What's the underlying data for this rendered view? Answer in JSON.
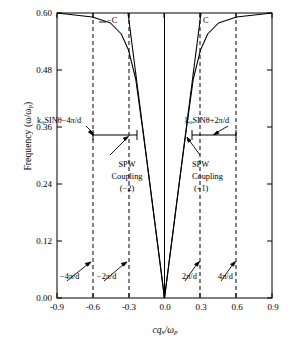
{
  "chart_data": {
    "type": "line",
    "title": "",
    "xlabel": "cq_x/ω_p",
    "ylabel": "Frequency (ω/ω_p)",
    "xlim": [
      -0.9,
      0.9
    ],
    "ylim": [
      0.0,
      0.6
    ],
    "xticks": [
      -0.9,
      -0.6,
      -0.3,
      0.0,
      0.3,
      0.6,
      0.9
    ],
    "xtick_labels": [
      "-0.9",
      "-0.6",
      "-0.3",
      "0.0",
      "0.3",
      "0.6",
      "0.9"
    ],
    "yticks": [
      0.0,
      0.12,
      0.24,
      0.36,
      0.48,
      0.6
    ],
    "ytick_labels": [
      "0.00",
      "0.12",
      "0.24",
      "0.36",
      "0.48",
      "0.60"
    ],
    "grid": false,
    "legend": "none",
    "series": [
      {
        "name": "light line +C",
        "style": "solid",
        "points": [
          [
            0.0,
            0.0
          ],
          [
            0.305,
            0.6
          ]
        ]
      },
      {
        "name": "light line -C",
        "style": "solid",
        "points": [
          [
            0.0,
            0.0
          ],
          [
            -0.305,
            0.6
          ]
        ]
      },
      {
        "name": "SPW dispersion right branch",
        "style": "solid",
        "points": [
          [
            0.0,
            0.0
          ],
          [
            0.06,
            0.118
          ],
          [
            0.12,
            0.236
          ],
          [
            0.18,
            0.352
          ],
          [
            0.24,
            0.462
          ],
          [
            0.3,
            0.522
          ],
          [
            0.36,
            0.556
          ],
          [
            0.45,
            0.578
          ],
          [
            0.6,
            0.591
          ],
          [
            0.75,
            0.597
          ],
          [
            0.9,
            0.6
          ]
        ]
      },
      {
        "name": "SPW dispersion left branch",
        "style": "solid",
        "points": [
          [
            0.0,
            0.0
          ],
          [
            -0.06,
            0.118
          ],
          [
            -0.12,
            0.236
          ],
          [
            -0.18,
            0.352
          ],
          [
            -0.24,
            0.462
          ],
          [
            -0.3,
            0.522
          ],
          [
            -0.36,
            0.556
          ],
          [
            -0.45,
            0.578
          ],
          [
            -0.6,
            0.591
          ],
          [
            -0.75,
            0.597
          ],
          [
            -0.9,
            0.6
          ]
        ]
      },
      {
        "name": "vertical axis line at zero",
        "style": "solid",
        "points": [
          [
            0.0,
            0.0
          ],
          [
            0.0,
            0.6
          ]
        ]
      }
    ],
    "vertical_dashed_lines": [
      {
        "x": -0.6,
        "label": "-4π/d"
      },
      {
        "x": -0.3,
        "label": "-2π/d"
      },
      {
        "x": 0.3,
        "label": "2π/d"
      },
      {
        "x": 0.6,
        "label": "4π/d"
      }
    ],
    "measurement_bars": [
      {
        "name": "left",
        "y": 0.355,
        "x_start": -0.47,
        "x_end": -0.095
      },
      {
        "name": "right",
        "y": 0.355,
        "x_start": 0.34,
        "x_end": 0.685
      }
    ]
  },
  "annotations": {
    "light_line_left": "−C",
    "light_line_right": "C",
    "k_left_html": "k<sub>o</sub>SINθ−4π/d",
    "k_right_html": "k<sub>o</sub>SINθ+2π/d",
    "spw_left_line1": "SPW",
    "spw_left_line2": "Coupling",
    "spw_left_line3": "(−2)",
    "spw_right_line1": "SPW",
    "spw_right_line2": "Coupling",
    "spw_right_line3": "(+1)",
    "bragg_neg4": "−4π/d",
    "bragg_neg2": "−2π/d",
    "bragg_pos2": "2π/d",
    "bragg_pos4": "4π/d"
  },
  "axes": {
    "ylabel_prefix": "Frequency (ω/ω",
    "ylabel_sub": "p",
    "ylabel_suffix": ")",
    "xlabel_main": "cq",
    "xlabel_sub": "x",
    "xlabel_mid": "/ω",
    "xlabel_sub2": "p"
  },
  "colors": {
    "line": "#000000",
    "background": "#ffffff",
    "frame": "#000000"
  }
}
